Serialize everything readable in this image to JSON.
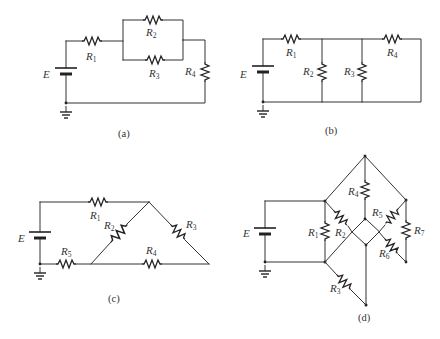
{
  "figure": {
    "panels": [
      {
        "id": "a",
        "caption": "(a)",
        "source_label": "E",
        "resistors": [
          {
            "name": "R",
            "sub": "1"
          },
          {
            "name": "R",
            "sub": "2"
          },
          {
            "name": "R",
            "sub": "3"
          },
          {
            "name": "R",
            "sub": "4"
          }
        ]
      },
      {
        "id": "b",
        "caption": "(b)",
        "source_label": "E",
        "resistors": [
          {
            "name": "R",
            "sub": "1"
          },
          {
            "name": "R",
            "sub": "2"
          },
          {
            "name": "R",
            "sub": "3"
          },
          {
            "name": "R",
            "sub": "4"
          }
        ]
      },
      {
        "id": "c",
        "caption": "(c)",
        "source_label": "E",
        "resistors": [
          {
            "name": "R",
            "sub": "1"
          },
          {
            "name": "R",
            "sub": "2"
          },
          {
            "name": "R",
            "sub": "3"
          },
          {
            "name": "R",
            "sub": "4"
          },
          {
            "name": "R",
            "sub": "5"
          }
        ]
      },
      {
        "id": "d",
        "caption": "(d)",
        "source_label": "E",
        "resistors": [
          {
            "name": "R",
            "sub": "1"
          },
          {
            "name": "R",
            "sub": "2"
          },
          {
            "name": "R",
            "sub": "3"
          },
          {
            "name": "R",
            "sub": "4"
          },
          {
            "name": "R",
            "sub": "5"
          },
          {
            "name": "R",
            "sub": "6"
          },
          {
            "name": "R",
            "sub": "7"
          }
        ]
      }
    ]
  }
}
